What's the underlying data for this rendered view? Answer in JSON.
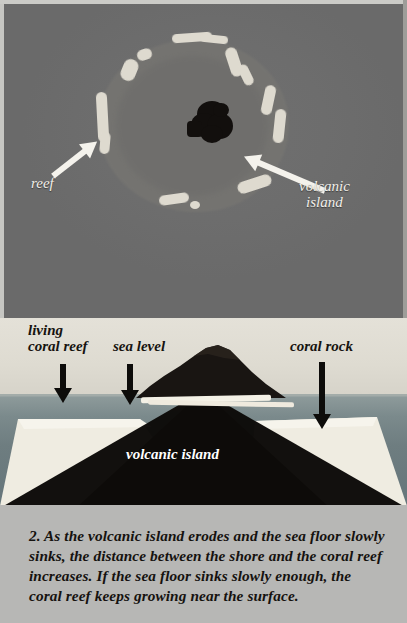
{
  "figure": {
    "step_number": "2.",
    "caption": "2. As the volcanic island erodes and the sea floor slowly sinks, the distance between the shore and the coral reef increases.  If the sea floor sinks slowly enough, the coral reef keeps growing near the surface."
  },
  "aerial_panel": {
    "name": "aerial-photo-atoll",
    "labels": {
      "reef": "reef",
      "volcanic_island": "volcanic\nisland"
    },
    "colors": {
      "ocean": "#6b6b6b",
      "lagoon": "#757471",
      "reef": "#dedacf",
      "island": "#120f0d",
      "label_text": "#f2f0ea"
    }
  },
  "cross_section_panel": {
    "name": "cross-section-diagram",
    "labels": {
      "living_coral_reef": "living\ncoral reef",
      "sea_level": "sea level",
      "coral_rock": "coral rock",
      "volcanic_island": "volcanic island"
    },
    "colors": {
      "sky": "#dedbd2",
      "sea": "#7b8a8c",
      "coral": "#efece1",
      "volcanic_rock": "#0d0b09",
      "arrow": "#0d0c0a",
      "label_text": "#16130f",
      "island_label_text": "#ffffff"
    }
  },
  "caption_panel": {
    "background": "#b7b7b5",
    "text_color": "#15120f"
  }
}
